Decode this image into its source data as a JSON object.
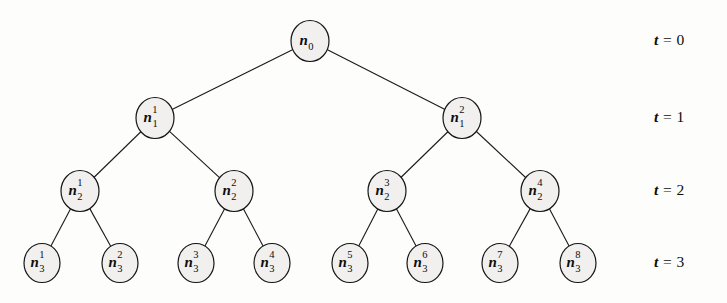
{
  "figure": {
    "type": "binary-tree-diagram",
    "node_radius": 19,
    "leaf_radius": 18,
    "colors": {
      "node_fill": "#f1f0ee",
      "node_stroke": "#161616",
      "edge_stroke": "#1a1a1a",
      "text": "#0d0d0d",
      "background": "#fdfdfc"
    }
  },
  "levels": [
    {
      "time_label": "t = 0",
      "t_value": "0",
      "y": 41
    },
    {
      "time_label": "t = 1",
      "t_value": "1",
      "y": 118
    },
    {
      "time_label": "t = 2",
      "t_value": "2",
      "y": 191
    },
    {
      "time_label": "t = 3",
      "t_value": "3",
      "y": 263
    }
  ],
  "time_labels": [
    {
      "name": "t-label-0",
      "var": "t",
      "eq": " = ",
      "value": "0",
      "text": "t = 0",
      "x": 654,
      "y": 31
    },
    {
      "name": "t-label-1",
      "var": "t",
      "eq": " = ",
      "value": "1",
      "text": "t = 1",
      "x": 654,
      "y": 108
    },
    {
      "name": "t-label-2",
      "var": "t",
      "eq": " = ",
      "value": "2",
      "text": "t = 2",
      "x": 654,
      "y": 181
    },
    {
      "name": "t-label-3",
      "var": "t",
      "eq": " = ",
      "value": "3",
      "text": "t = 3",
      "x": 654,
      "y": 253
    }
  ],
  "nodes": [
    {
      "id": "n0",
      "base": "n",
      "sub": "0",
      "sup": "",
      "cx": 310,
      "cy": 41,
      "r": 19,
      "level": 0
    },
    {
      "id": "n1_1",
      "base": "n",
      "sub": "1",
      "sup": "1",
      "cx": 155,
      "cy": 118,
      "r": 19,
      "level": 1
    },
    {
      "id": "n1_2",
      "base": "n",
      "sub": "1",
      "sup": "2",
      "cx": 462,
      "cy": 118,
      "r": 19,
      "level": 1
    },
    {
      "id": "n2_1",
      "base": "n",
      "sub": "2",
      "sup": "1",
      "cx": 80,
      "cy": 191,
      "r": 19,
      "level": 2
    },
    {
      "id": "n2_2",
      "base": "n",
      "sub": "2",
      "sup": "2",
      "cx": 234,
      "cy": 191,
      "r": 19,
      "level": 2
    },
    {
      "id": "n2_3",
      "base": "n",
      "sub": "2",
      "sup": "3",
      "cx": 387,
      "cy": 191,
      "r": 19,
      "level": 2
    },
    {
      "id": "n2_4",
      "base": "n",
      "sub": "2",
      "sup": "4",
      "cx": 540,
      "cy": 191,
      "r": 19,
      "level": 2
    },
    {
      "id": "n3_1",
      "base": "n",
      "sub": "3",
      "sup": "1",
      "cx": 42,
      "cy": 263,
      "r": 18,
      "level": 3
    },
    {
      "id": "n3_2",
      "base": "n",
      "sub": "3",
      "sup": "2",
      "cx": 120,
      "cy": 263,
      "r": 18,
      "level": 3
    },
    {
      "id": "n3_3",
      "base": "n",
      "sub": "3",
      "sup": "3",
      "cx": 196,
      "cy": 263,
      "r": 18,
      "level": 3
    },
    {
      "id": "n3_4",
      "base": "n",
      "sub": "3",
      "sup": "4",
      "cx": 272,
      "cy": 263,
      "r": 18,
      "level": 3
    },
    {
      "id": "n3_5",
      "base": "n",
      "sub": "3",
      "sup": "5",
      "cx": 350,
      "cy": 263,
      "r": 18,
      "level": 3
    },
    {
      "id": "n3_6",
      "base": "n",
      "sub": "3",
      "sup": "6",
      "cx": 425,
      "cy": 263,
      "r": 18,
      "level": 3
    },
    {
      "id": "n3_7",
      "base": "n",
      "sub": "3",
      "sup": "7",
      "cx": 500,
      "cy": 263,
      "r": 18,
      "level": 3
    },
    {
      "id": "n3_8",
      "base": "n",
      "sub": "3",
      "sup": "8",
      "cx": 578,
      "cy": 263,
      "r": 18,
      "level": 3
    }
  ],
  "edges": [
    {
      "from": "n0",
      "to": "n1_1"
    },
    {
      "from": "n0",
      "to": "n1_2"
    },
    {
      "from": "n1_1",
      "to": "n2_1"
    },
    {
      "from": "n1_1",
      "to": "n2_2"
    },
    {
      "from": "n1_2",
      "to": "n2_3"
    },
    {
      "from": "n1_2",
      "to": "n2_4"
    },
    {
      "from": "n2_1",
      "to": "n3_1"
    },
    {
      "from": "n2_1",
      "to": "n3_2"
    },
    {
      "from": "n2_2",
      "to": "n3_3"
    },
    {
      "from": "n2_2",
      "to": "n3_4"
    },
    {
      "from": "n2_3",
      "to": "n3_5"
    },
    {
      "from": "n2_3",
      "to": "n3_6"
    },
    {
      "from": "n2_4",
      "to": "n3_7"
    },
    {
      "from": "n2_4",
      "to": "n3_8"
    }
  ]
}
